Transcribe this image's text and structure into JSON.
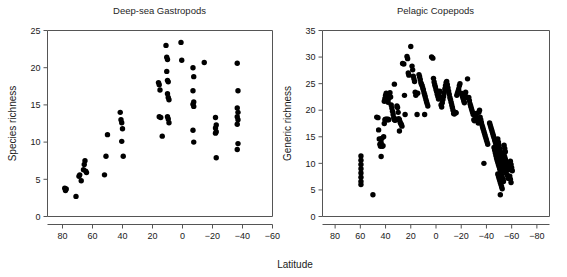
{
  "figure": {
    "shared_xlabel": "Latitude"
  },
  "chart_data": [
    {
      "type": "scatter",
      "panel": "left",
      "title": "Deep-sea Gastropods",
      "xlabel": "Latitude",
      "ylabel": "Species richness",
      "xlim": [
        90,
        -60
      ],
      "ylim": [
        0,
        25
      ],
      "xticks": [
        80,
        60,
        40,
        20,
        0,
        -20,
        -40,
        -60
      ],
      "xticklabels": [
        "80",
        "60",
        "40",
        "20",
        "0",
        "−20",
        "−40",
        "−60"
      ],
      "yticks": [
        0,
        5,
        10,
        15,
        20,
        25
      ],
      "yticklabels": [
        "0",
        "5",
        "10",
        "15",
        "20",
        "25"
      ],
      "grid": false,
      "legend": null,
      "marker": "filled-circle",
      "marker_color": "#000000",
      "points": [
        [
          78.5,
          3.8
        ],
        [
          78.0,
          3.5
        ],
        [
          77.5,
          3.7
        ],
        [
          71.0,
          2.7
        ],
        [
          69.0,
          5.4
        ],
        [
          68.5,
          5.6
        ],
        [
          67.5,
          4.8
        ],
        [
          66.0,
          6.3
        ],
        [
          65.5,
          7.0
        ],
        [
          65.0,
          7.5
        ],
        [
          64.5,
          6.1
        ],
        [
          64.0,
          5.9
        ],
        [
          52.0,
          5.6
        ],
        [
          51.0,
          8.1
        ],
        [
          50.0,
          11.0
        ],
        [
          41.5,
          14.0
        ],
        [
          41.0,
          13.0
        ],
        [
          40.5,
          12.6
        ],
        [
          40.0,
          11.8
        ],
        [
          40.5,
          10.1
        ],
        [
          39.5,
          8.1
        ],
        [
          16.0,
          18.0
        ],
        [
          15.5,
          17.7
        ],
        [
          15.0,
          17.0
        ],
        [
          15.5,
          13.4
        ],
        [
          14.5,
          13.3
        ],
        [
          13.5,
          10.8
        ],
        [
          11.0,
          23.0
        ],
        [
          10.5,
          21.4
        ],
        [
          10.0,
          21.1
        ],
        [
          10.5,
          19.5
        ],
        [
          10.0,
          18.3
        ],
        [
          9.5,
          18.1
        ],
        [
          10.0,
          16.5
        ],
        [
          9.5,
          16.0
        ],
        [
          9.0,
          15.7
        ],
        [
          10.0,
          13.4
        ],
        [
          9.5,
          13.1
        ],
        [
          9.0,
          12.6
        ],
        [
          1.0,
          23.4
        ],
        [
          0.5,
          21.0
        ],
        [
          -7.0,
          20.0
        ],
        [
          -7.5,
          18.8
        ],
        [
          -7.0,
          16.9
        ],
        [
          -7.5,
          15.4
        ],
        [
          -7.0,
          15.1
        ],
        [
          -7.5,
          14.8
        ],
        [
          -7.0,
          11.6
        ],
        [
          -7.5,
          10.0
        ],
        [
          -14.5,
          20.7
        ],
        [
          -22.0,
          13.3
        ],
        [
          -22.5,
          12.3
        ],
        [
          -22.0,
          11.9
        ],
        [
          -22.5,
          11.4
        ],
        [
          -22.0,
          11.2
        ],
        [
          -22.5,
          7.9
        ],
        [
          -36.5,
          20.6
        ],
        [
          -37.0,
          16.9
        ],
        [
          -36.5,
          14.6
        ],
        [
          -37.0,
          14.0
        ],
        [
          -36.5,
          13.4
        ],
        [
          -37.0,
          13.0
        ],
        [
          -36.5,
          12.4
        ],
        [
          -37.0,
          9.8
        ],
        [
          -36.5,
          9.0
        ]
      ]
    },
    {
      "type": "scatter",
      "panel": "right",
      "title": "Pelagic Copepods",
      "xlabel": "Latitude",
      "ylabel": "Generic richness",
      "xlim": [
        90,
        -90
      ],
      "ylim": [
        0,
        35
      ],
      "xticks": [
        80,
        60,
        40,
        20,
        0,
        -20,
        -40,
        -60,
        -80
      ],
      "xticklabels": [
        "80",
        "60",
        "40",
        "20",
        "0",
        "−20",
        "−40",
        "−60",
        "−80"
      ],
      "yticks": [
        0,
        5,
        10,
        15,
        20,
        25,
        30,
        35
      ],
      "yticklabels": [
        "0",
        "5",
        "10",
        "15",
        "20",
        "25",
        "30",
        "35"
      ],
      "grid": false,
      "legend": null,
      "marker": "filled-circle",
      "marker_color": "#000000",
      "points": [
        [
          59.5,
          11.4
        ],
        [
          59.5,
          10.6
        ],
        [
          59.5,
          9.8
        ],
        [
          59.5,
          9.0
        ],
        [
          59.5,
          8.2
        ],
        [
          59.5,
          7.4
        ],
        [
          59.5,
          6.6
        ],
        [
          59.5,
          6.0
        ],
        [
          50.0,
          4.1
        ],
        [
          47.0,
          18.7
        ],
        [
          46.0,
          18.6
        ],
        [
          45.5,
          16.3
        ],
        [
          45.0,
          14.6
        ],
        [
          44.5,
          13.6
        ],
        [
          44.0,
          13.2
        ],
        [
          43.5,
          13.9
        ],
        [
          43.0,
          14.7
        ],
        [
          43.5,
          11.3
        ],
        [
          42.5,
          13.2
        ],
        [
          42.0,
          13.3
        ],
        [
          41.5,
          15.0
        ],
        [
          41.0,
          17.5
        ],
        [
          40.5,
          18.2
        ],
        [
          40.0,
          18.3
        ],
        [
          39.5,
          18.2
        ],
        [
          39.0,
          18.3
        ],
        [
          38.5,
          18.2
        ],
        [
          38.0,
          18.3
        ],
        [
          37.5,
          18.2
        ],
        [
          41.0,
          21.7
        ],
        [
          40.5,
          22.2
        ],
        [
          40.0,
          22.8
        ],
        [
          39.5,
          23.2
        ],
        [
          39.0,
          22.3
        ],
        [
          38.5,
          21.8
        ],
        [
          38.0,
          21.5
        ],
        [
          37.5,
          22.2
        ],
        [
          37.0,
          22.8
        ],
        [
          36.5,
          23.3
        ],
        [
          36.0,
          22.5
        ],
        [
          35.5,
          21.0
        ],
        [
          35.0,
          20.4
        ],
        [
          34.5,
          19.8
        ],
        [
          34.0,
          19.2
        ],
        [
          33.5,
          18.6
        ],
        [
          33.0,
          18.2
        ],
        [
          32.5,
          18.1
        ],
        [
          32.0,
          18.2
        ],
        [
          31.5,
          18.3
        ],
        [
          33.0,
          24.9
        ],
        [
          31.0,
          20.8
        ],
        [
          30.5,
          20.5
        ],
        [
          30.0,
          19.6
        ],
        [
          29.5,
          18.4
        ],
        [
          29.0,
          18.2
        ],
        [
          28.5,
          17.8
        ],
        [
          28.0,
          17.5
        ],
        [
          27.5,
          17.3
        ],
        [
          27.0,
          17.0
        ],
        [
          29.0,
          16.1
        ],
        [
          26.5,
          28.8
        ],
        [
          25.5,
          28.7
        ],
        [
          25.0,
          22.8
        ],
        [
          24.5,
          19.2
        ],
        [
          23.0,
          30.1
        ],
        [
          22.5,
          29.7
        ],
        [
          22.0,
          27.0
        ],
        [
          21.5,
          26.6
        ],
        [
          20.0,
          32.0
        ],
        [
          19.0,
          28.3
        ],
        [
          18.5,
          27.6
        ],
        [
          18.0,
          26.4
        ],
        [
          17.5,
          25.9
        ],
        [
          17.0,
          25.4
        ],
        [
          16.5,
          23.4
        ],
        [
          16.0,
          22.8
        ],
        [
          15.0,
          19.2
        ],
        [
          14.5,
          23.2
        ],
        [
          13.5,
          26.7
        ],
        [
          13.0,
          26.3
        ],
        [
          12.5,
          25.8
        ],
        [
          12.0,
          25.2
        ],
        [
          11.5,
          24.9
        ],
        [
          11.0,
          24.6
        ],
        [
          10.5,
          24.2
        ],
        [
          10.0,
          23.8
        ],
        [
          9.5,
          23.3
        ],
        [
          9.0,
          22.9
        ],
        [
          8.5,
          22.5
        ],
        [
          8.0,
          22.0
        ],
        [
          7.5,
          21.6
        ],
        [
          7.0,
          21.2
        ],
        [
          6.5,
          20.8
        ],
        [
          9.0,
          19.2
        ],
        [
          3.5,
          30.0
        ],
        [
          2.5,
          29.8
        ],
        [
          2.0,
          26.0
        ],
        [
          1.5,
          25.3
        ],
        [
          1.0,
          24.8
        ],
        [
          0.5,
          24.4
        ],
        [
          0.0,
          23.9
        ],
        [
          -0.5,
          23.5
        ],
        [
          -1.0,
          23.0
        ],
        [
          -1.5,
          22.6
        ],
        [
          -2.0,
          22.1
        ],
        [
          -2.5,
          23.2
        ],
        [
          -3.0,
          23.6
        ],
        [
          -3.5,
          22.4
        ],
        [
          -4.0,
          21.0
        ],
        [
          -4.5,
          20.6
        ],
        [
          -5.0,
          21.4
        ],
        [
          -5.5,
          22.0
        ],
        [
          -6.0,
          22.6
        ],
        [
          -6.5,
          23.3
        ],
        [
          -7.0,
          24.0
        ],
        [
          -7.5,
          24.6
        ],
        [
          -8.0,
          25.2
        ],
        [
          -8.5,
          25.4
        ],
        [
          -9.0,
          24.8
        ],
        [
          -9.5,
          24.2
        ],
        [
          -10.0,
          23.6
        ],
        [
          -10.5,
          23.0
        ],
        [
          -11.0,
          22.4
        ],
        [
          -11.5,
          22.0
        ],
        [
          -12.0,
          21.5
        ],
        [
          -12.5,
          21.0
        ],
        [
          -13.0,
          20.5
        ],
        [
          -13.5,
          20.0
        ],
        [
          -14.0,
          19.4
        ],
        [
          -14.5,
          19.3
        ],
        [
          -15.5,
          19.6
        ],
        [
          -16.0,
          19.5
        ],
        [
          -16.5,
          22.8
        ],
        [
          -17.0,
          23.2
        ],
        [
          -17.5,
          23.6
        ],
        [
          -18.0,
          24.0
        ],
        [
          -18.5,
          24.6
        ],
        [
          -19.0,
          25.0
        ],
        [
          -20.0,
          23.2
        ],
        [
          -20.5,
          23.0
        ],
        [
          -21.0,
          22.6
        ],
        [
          -21.5,
          22.2
        ],
        [
          -22.0,
          21.8
        ],
        [
          -22.5,
          21.4
        ],
        [
          -23.0,
          23.0
        ],
        [
          -23.5,
          23.4
        ],
        [
          -24.0,
          22.4
        ],
        [
          -25.0,
          25.9
        ],
        [
          -26.0,
          22.4
        ],
        [
          -26.5,
          21.8
        ],
        [
          -27.0,
          21.2
        ],
        [
          -27.5,
          20.8
        ],
        [
          -28.0,
          20.4
        ],
        [
          -28.5,
          20.0
        ],
        [
          -29.0,
          19.6
        ],
        [
          -29.5,
          19.2
        ],
        [
          -30.0,
          18.2
        ],
        [
          -30.5,
          18.0
        ],
        [
          -31.5,
          18.9
        ],
        [
          -32.0,
          19.4
        ],
        [
          -32.5,
          18.5
        ],
        [
          -33.0,
          18.0
        ],
        [
          -33.5,
          17.6
        ],
        [
          -34.0,
          19.6
        ],
        [
          -34.5,
          20.0
        ],
        [
          -35.0,
          18.7
        ],
        [
          -35.5,
          18.2
        ],
        [
          -36.0,
          17.7
        ],
        [
          -36.5,
          17.2
        ],
        [
          -37.0,
          16.8
        ],
        [
          -37.5,
          16.4
        ],
        [
          -38.0,
          16.0
        ],
        [
          -38.5,
          15.6
        ],
        [
          -39.0,
          15.2
        ],
        [
          -39.5,
          14.8
        ],
        [
          -40.0,
          14.4
        ],
        [
          -40.5,
          14.0
        ],
        [
          -41.0,
          13.6
        ],
        [
          -38.0,
          10.0
        ],
        [
          -42.5,
          17.6
        ],
        [
          -43.0,
          17.2
        ],
        [
          -43.5,
          16.8
        ],
        [
          -44.0,
          16.4
        ],
        [
          -44.5,
          16.0
        ],
        [
          -45.0,
          15.6
        ],
        [
          -45.5,
          15.2
        ],
        [
          -46.0,
          14.8
        ],
        [
          -46.5,
          14.4
        ],
        [
          -47.0,
          14.0
        ],
        [
          -47.5,
          13.6
        ],
        [
          -48.0,
          13.2
        ],
        [
          -48.5,
          12.8
        ],
        [
          -49.0,
          12.4
        ],
        [
          -49.5,
          12.0
        ],
        [
          -50.0,
          11.6
        ],
        [
          -50.5,
          11.2
        ],
        [
          -51.0,
          10.8
        ],
        [
          -51.5,
          10.4
        ],
        [
          -52.0,
          10.0
        ],
        [
          -46.0,
          13.0
        ],
        [
          -46.5,
          12.5
        ],
        [
          -47.0,
          12.0
        ],
        [
          -47.5,
          11.5
        ],
        [
          -48.0,
          11.0
        ],
        [
          -48.5,
          10.6
        ],
        [
          -49.0,
          10.2
        ],
        [
          -49.5,
          9.8
        ],
        [
          -50.0,
          9.4
        ],
        [
          -50.5,
          9.0
        ],
        [
          -51.0,
          8.6
        ],
        [
          -51.5,
          8.2
        ],
        [
          -52.0,
          7.8
        ],
        [
          -52.5,
          7.4
        ],
        [
          -53.0,
          7.0
        ],
        [
          -53.5,
          6.6
        ],
        [
          -49.0,
          8.0
        ],
        [
          -49.5,
          7.6
        ],
        [
          -50.0,
          7.2
        ],
        [
          -50.5,
          6.8
        ],
        [
          -51.0,
          6.4
        ],
        [
          -51.5,
          6.0
        ],
        [
          -52.0,
          5.6
        ],
        [
          -52.5,
          5.2
        ],
        [
          -51.0,
          4.1
        ],
        [
          -54.0,
          11.8
        ],
        [
          -54.5,
          11.2
        ],
        [
          -55.0,
          10.8
        ],
        [
          -55.5,
          10.4
        ],
        [
          -56.0,
          10.0
        ],
        [
          -56.5,
          9.6
        ],
        [
          -57.0,
          9.2
        ],
        [
          -57.5,
          8.8
        ],
        [
          -58.0,
          9.4
        ],
        [
          -58.5,
          10.0
        ],
        [
          -59.0,
          10.4
        ],
        [
          -59.5,
          9.8
        ],
        [
          -60.0,
          9.2
        ],
        [
          -60.5,
          8.6
        ],
        [
          -58.5,
          7.6
        ],
        [
          -59.0,
          7.0
        ],
        [
          -59.5,
          6.4
        ],
        [
          -57.0,
          7.2
        ],
        [
          -56.5,
          7.8
        ],
        [
          -55.5,
          8.2
        ],
        [
          -54.5,
          8.6
        ],
        [
          -53.5,
          9.2
        ],
        [
          -53.0,
          9.8
        ],
        [
          -52.5,
          10.4
        ],
        [
          -52.0,
          11.0
        ],
        [
          -51.5,
          11.6
        ],
        [
          -51.0,
          12.2
        ],
        [
          -50.5,
          12.8
        ],
        [
          -50.0,
          13.4
        ],
        [
          -49.5,
          14.0
        ],
        [
          -49.0,
          14.6
        ],
        [
          -54.0,
          13.4
        ],
        [
          -54.5,
          12.8
        ],
        [
          -55.0,
          12.2
        ],
        [
          -53.5,
          12.0
        ],
        [
          -53.0,
          11.4
        ]
      ]
    }
  ]
}
